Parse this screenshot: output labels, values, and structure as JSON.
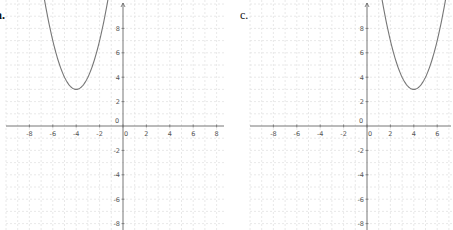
{
  "chart_data": [
    {
      "type": "line",
      "label": "a.",
      "title": "",
      "xlabel": "",
      "ylabel": "",
      "function": "y = (x + 4)^2 + 3",
      "vertex": [
        -4,
        3
      ],
      "xlim": [
        -10,
        9.5
      ],
      "ylim": [
        -8.5,
        10
      ],
      "x_ticks": [
        -8,
        -6,
        -4,
        -2,
        0,
        2,
        4,
        6,
        8
      ],
      "y_ticks": [
        -8,
        -6,
        -4,
        -2,
        0,
        2,
        4,
        6,
        8
      ],
      "grid": true,
      "series": [
        {
          "name": "parabola",
          "x": [
            -6.6,
            -6,
            -5,
            -4,
            -3,
            -2,
            -1.4
          ],
          "y": [
            9.76,
            7,
            4,
            3,
            4,
            7,
            9.76
          ]
        }
      ]
    },
    {
      "type": "line",
      "label": "c.",
      "title": "",
      "xlabel": "",
      "ylabel": "",
      "function": "y = (x - 4)^2 + 3",
      "vertex": [
        4,
        3
      ],
      "xlim": [
        -10.5,
        7
      ],
      "ylim": [
        -8.5,
        10
      ],
      "x_ticks": [
        -8,
        -6,
        -4,
        -2,
        0,
        2,
        4,
        6
      ],
      "y_ticks": [
        -8,
        -6,
        -4,
        -2,
        0,
        2,
        4,
        6,
        8
      ],
      "grid": true,
      "series": [
        {
          "name": "parabola",
          "x": [
            1.4,
            2,
            3,
            4,
            5,
            6,
            6.6
          ],
          "y": [
            9.76,
            7,
            4,
            3,
            4,
            7,
            9.76
          ]
        }
      ]
    }
  ],
  "panels": [
    {
      "label": "a.",
      "x_tick_labels": [
        "-8",
        "-6",
        "-4",
        "-2",
        "0",
        "2",
        "4",
        "6",
        "8"
      ],
      "y_tick_labels": [
        "8",
        "6",
        "4",
        "2",
        "0",
        "-2",
        "-4",
        "-6",
        "-8"
      ]
    },
    {
      "label": "c.",
      "x_tick_labels": [
        "-8",
        "-6",
        "-4",
        "-2",
        "0",
        "2",
        "4",
        "6"
      ],
      "y_tick_labels": [
        "8",
        "6",
        "4",
        "2",
        "0",
        "-2",
        "-4",
        "-6",
        "-8"
      ]
    }
  ]
}
